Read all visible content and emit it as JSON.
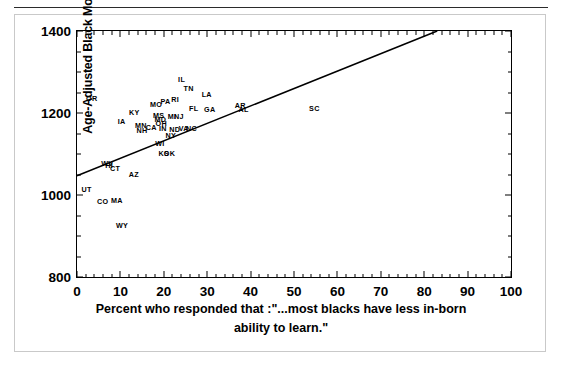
{
  "chart_data": {
    "type": "scatter",
    "title": "",
    "xlabel": "Percent who responded that :\"...most blacks have less in-born ability to learn.\"",
    "ylabel": "Age-Adjusted Black Mortality Rate",
    "xlim": [
      0,
      100
    ],
    "ylim": [
      800,
      1400
    ],
    "xticks": [
      0,
      10,
      20,
      30,
      40,
      50,
      60,
      70,
      80,
      90,
      100
    ],
    "xtick_labels": [
      "0",
      "10",
      "20",
      "30",
      "40",
      "50",
      "60",
      "70",
      "80",
      "90",
      "100"
    ],
    "yticks": [
      800,
      1000,
      1200,
      1400
    ],
    "ytick_labels": [
      "800",
      "1000",
      "1200",
      "1400"
    ],
    "x_minor_step": 2,
    "y_minor_step": 50,
    "grid": false,
    "legend": false,
    "marker_style": "state-abbreviation-text",
    "points": [
      {
        "label": "OR",
        "x": 3.4,
        "y": 1233
      },
      {
        "label": "IA",
        "x": 10.3,
        "y": 1178
      },
      {
        "label": "KY",
        "x": 13.2,
        "y": 1200
      },
      {
        "label": "MN",
        "x": 14.7,
        "y": 1168
      },
      {
        "label": "NH",
        "x": 15.0,
        "y": 1157
      },
      {
        "label": "CA",
        "x": 17.1,
        "y": 1163
      },
      {
        "label": "MO",
        "x": 18.2,
        "y": 1220
      },
      {
        "label": "MS",
        "x": 18.8,
        "y": 1193
      },
      {
        "label": "MD",
        "x": 19.2,
        "y": 1182
      },
      {
        "label": "OH",
        "x": 19.4,
        "y": 1174
      },
      {
        "label": "IN",
        "x": 19.8,
        "y": 1160
      },
      {
        "label": "PA",
        "x": 20.4,
        "y": 1228
      },
      {
        "label": "RI",
        "x": 22.6,
        "y": 1231
      },
      {
        "label": "IL",
        "x": 24.1,
        "y": 1281
      },
      {
        "label": "MI",
        "x": 21.9,
        "y": 1190
      },
      {
        "label": "NJ",
        "x": 23.5,
        "y": 1190
      },
      {
        "label": "ND",
        "x": 22.5,
        "y": 1159
      },
      {
        "label": "VA",
        "x": 24.6,
        "y": 1160
      },
      {
        "label": "NC",
        "x": 26.4,
        "y": 1160
      },
      {
        "label": "NY",
        "x": 21.6,
        "y": 1145
      },
      {
        "label": "TN",
        "x": 25.7,
        "y": 1258
      },
      {
        "label": "FL",
        "x": 26.9,
        "y": 1210
      },
      {
        "label": "LA",
        "x": 29.9,
        "y": 1243
      },
      {
        "label": "GA",
        "x": 30.6,
        "y": 1208
      },
      {
        "label": "AR",
        "x": 37.6,
        "y": 1218
      },
      {
        "label": "AL",
        "x": 38.4,
        "y": 1207
      },
      {
        "label": "SC",
        "x": 54.7,
        "y": 1210
      },
      {
        "label": "WI",
        "x": 19.1,
        "y": 1124
      },
      {
        "label": "KS",
        "x": 20.0,
        "y": 1099
      },
      {
        "label": "OK",
        "x": 21.3,
        "y": 1100
      },
      {
        "label": "WV",
        "x": 7.0,
        "y": 1075
      },
      {
        "label": "HI",
        "x": 7.4,
        "y": 1070
      },
      {
        "label": "CT",
        "x": 8.8,
        "y": 1063
      },
      {
        "label": "AZ",
        "x": 13.1,
        "y": 1050
      },
      {
        "label": "UT",
        "x": 2.2,
        "y": 1012
      },
      {
        "label": "CO",
        "x": 5.9,
        "y": 983
      },
      {
        "label": "MA",
        "x": 9.2,
        "y": 985
      },
      {
        "label": "WY",
        "x": 10.4,
        "y": 924
      }
    ],
    "fit_line": {
      "type": "linear",
      "x_start": 0,
      "y_start": 1047,
      "x_end": 83,
      "y_end": 1400,
      "color": "#000000"
    }
  },
  "figure": {
    "y_axis_title": "Age-Adjusted Black Mortality Rate",
    "x_caption_line1": "Percent who responded that :\"...most blacks have less in-born",
    "x_caption_line2": "ability to learn.\""
  }
}
